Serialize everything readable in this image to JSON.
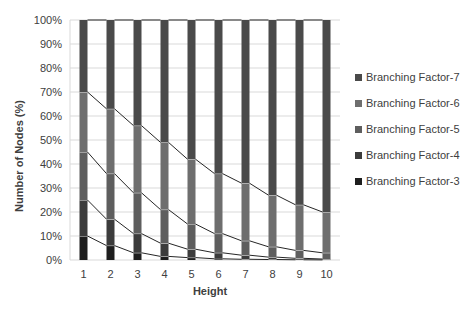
{
  "chart_data": {
    "type": "bar",
    "stacked": true,
    "percent_stacked": true,
    "title": "",
    "xlabel": "Height",
    "ylabel": "Number of Nodes (%)",
    "ylim": [
      0,
      100
    ],
    "yticks": [
      "0%",
      "10%",
      "20%",
      "30%",
      "40%",
      "50%",
      "60%",
      "70%",
      "80%",
      "90%",
      "100%"
    ],
    "categories": [
      "1",
      "2",
      "3",
      "4",
      "5",
      "6",
      "7",
      "8",
      "9",
      "10"
    ],
    "grid": true,
    "legend_position": "right",
    "series_lines": true,
    "series": [
      {
        "name": "Branching Factor-3",
        "color": "#1e1e1e",
        "values": [
          10,
          6,
          3,
          1.5,
          1,
          0.5,
          0.3,
          0.2,
          0.1,
          0.05
        ]
      },
      {
        "name": "Branching Factor-4",
        "color": "#3c3c3c",
        "values": [
          15,
          11,
          8,
          5.5,
          3.5,
          2.5,
          1.7,
          1.0,
          0.6,
          0.35
        ]
      },
      {
        "name": "Branching Factor-5",
        "color": "#5e5e5e",
        "values": [
          20,
          19,
          17,
          14,
          10.5,
          8,
          6,
          4.3,
          3.3,
          2.6
        ]
      },
      {
        "name": "Branching Factor-6",
        "color": "#6e6e6e",
        "values": [
          25,
          27,
          28,
          28,
          27,
          25,
          24,
          21.5,
          19,
          17
        ]
      },
      {
        "name": "Branching Factor-7",
        "color": "#4a4a4a",
        "values": [
          30,
          37,
          44,
          51,
          58,
          64,
          68,
          73,
          77,
          80
        ]
      }
    ]
  },
  "legend": {
    "items": [
      {
        "label": "Branching Factor-7",
        "color": "#4a4a4a"
      },
      {
        "label": "Branching Factor-6",
        "color": "#6e6e6e"
      },
      {
        "label": "Branching Factor-5",
        "color": "#5e5e5e"
      },
      {
        "label": "Branching Factor-4",
        "color": "#3c3c3c"
      },
      {
        "label": "Branching Factor-3",
        "color": "#1e1e1e"
      }
    ]
  }
}
